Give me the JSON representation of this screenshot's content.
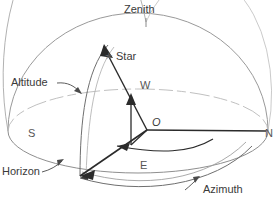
{
  "figure": {
    "labels": {
      "zenith": "Zenith",
      "star": "Star",
      "altitude": "Altitude",
      "horizon": "Horizon",
      "azimuth": "Azimuth",
      "origin": "O",
      "north": "N",
      "south": "S",
      "east": "E",
      "west": "W"
    },
    "icons": {
      "star_marker": "star-icon"
    },
    "colors": {
      "sphere_outline": "#9a9a9a",
      "horizon_line": "#8f8f8f",
      "vector_line": "#2b2b2b",
      "text": "#3a3a3a",
      "background": "#ffffff"
    }
  }
}
